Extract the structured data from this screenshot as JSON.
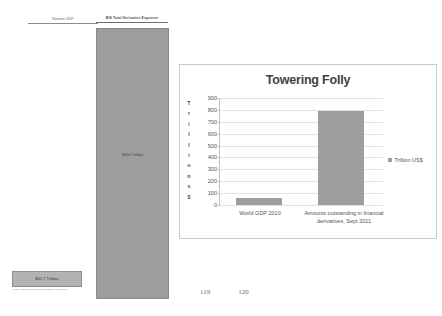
{
  "slide": {
    "gdp_column_header": "Nations GDP",
    "derivatives_column_header": "BIS Total Derivative Exposure",
    "derivatives_bar_value": "$55x Trillion",
    "gdp_box_value": "$62.7 Trillion",
    "source_note": "Source: Bank for International Settlements, www.bis.org"
  },
  "page_numbers": {
    "left": "119",
    "right": "120"
  },
  "colors": {
    "bar_fill": "#9d9d9d",
    "gridline": "#e2e2e2",
    "axis": "#c4c4c4",
    "panel_border": "#c9c9c9",
    "text": "#555555"
  },
  "chart_data": {
    "type": "bar",
    "title": "Towering Folly",
    "xlabel": "",
    "ylabel": "Trillions $",
    "ylabel_chars": [
      "T",
      "r",
      "i",
      "l",
      "l",
      "i",
      "o",
      "n",
      "s",
      "$"
    ],
    "categories": [
      "World GDP 2010",
      "Amounts outstanding in financial derivatives, Sept 2011"
    ],
    "values": [
      63,
      790
    ],
    "series": [
      {
        "name": "Trillion US$",
        "values": [
          63,
          790
        ]
      }
    ],
    "ylim": [
      0,
      900
    ],
    "yticks": [
      900,
      800,
      700,
      600,
      500,
      400,
      300,
      200,
      100,
      0
    ],
    "grid": true,
    "legend_position": "right",
    "legend_entries": [
      "Trillion US$"
    ]
  }
}
